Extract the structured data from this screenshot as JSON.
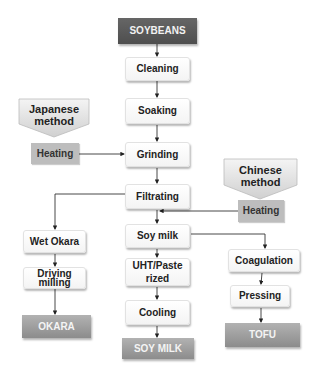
{
  "diagram": {
    "start": "SOYBEANS",
    "main_steps": [
      "Cleaning",
      "Soaking",
      "Grinding",
      "Filtrating",
      "Soy milk",
      "UHT/Paste rized",
      "Cooling"
    ],
    "japanese": {
      "label_line1": "Japanese",
      "label_line2": "method",
      "step": "Heating"
    },
    "chinese": {
      "label_line1": "Chinese",
      "label_line2": "method",
      "step": "Heating"
    },
    "okara_branch": {
      "steps": [
        "Wet Okara",
        "Driying milling"
      ],
      "product": "OKARA"
    },
    "tofu_branch": {
      "steps": [
        "Coagulation",
        "Pressing"
      ],
      "product": "TOFU"
    },
    "soymilk_product": "SOY MILK",
    "uht_line1": "UHT/Paste",
    "uht_line2": "rized",
    "drying_line1": "Driying",
    "drying_line2": "milling"
  }
}
